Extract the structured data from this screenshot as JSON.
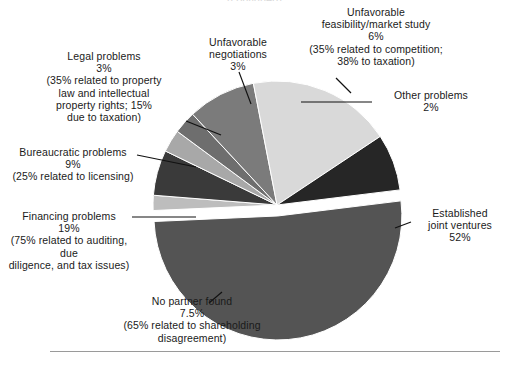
{
  "figure": {
    "clipped_title": "(continued)",
    "background": "#ffffff",
    "rule_color": "#9a9a9a"
  },
  "chart_data": {
    "type": "pie",
    "title": "",
    "xlabel": "",
    "ylabel": "",
    "legend_position": "none",
    "grid": false,
    "labels_outside": true,
    "total": 100,
    "categories": [
      "Established joint ventures",
      "Financing problems",
      "Bureaucratic problems",
      "No partner found",
      "Unfavorable feasibility/market study",
      "Legal problems",
      "Unfavorable negotiations",
      "Other problems"
    ],
    "values": [
      52,
      19,
      9,
      7.5,
      6,
      3,
      3,
      2
    ],
    "value_labels": [
      "52%",
      "19%",
      "9%",
      "7.5%",
      "6%",
      "3%",
      "3%",
      "2%"
    ],
    "colors": [
      "#545454",
      "#d9d9d9",
      "#7b7b7b",
      "#262626",
      "#bdbdbd",
      "#6e6e6e",
      "#a8a8a8",
      "#3a3a3a"
    ],
    "exploded": [
      "Established joint ventures"
    ],
    "slices": [
      {
        "name": "established-joint-ventures",
        "label": "Established\njoint ventures",
        "value_label": "52%",
        "note": "",
        "color": "#545454"
      },
      {
        "name": "other-problems",
        "label": "Other problems",
        "value_label": "2%",
        "note": "",
        "color": "#bdbdbd"
      },
      {
        "name": "unfavorable-feasibility-market-study",
        "label": "Unfavorable\nfeasibility/market study",
        "value_label": "6%",
        "note": "(35% related to competition;\n38% to taxation)",
        "color": "#3a3a3a"
      },
      {
        "name": "unfavorable-negotiations",
        "label": "Unfavorable\nnegotiations",
        "value_label": "3%",
        "note": "",
        "color": "#a8a8a8"
      },
      {
        "name": "legal-problems",
        "label": "Legal problems",
        "value_label": "3%",
        "note": "(35% related to property\nlaw and intellectual\nproperty rights; 15%\ndue to taxation)",
        "color": "#6e6e6e"
      },
      {
        "name": "bureaucratic-problems",
        "label": "Bureaucratic problems",
        "value_label": "9%",
        "note": "(25% related to licensing)",
        "color": "#7b7b7b"
      },
      {
        "name": "financing-problems",
        "label": "Financing problems",
        "value_label": "19%",
        "note": "(75% related to auditing, due\ndiligence, and tax issues)",
        "color": "#d9d9d9"
      },
      {
        "name": "no-partner-found",
        "label": "No partner found",
        "value_label": "7.5%",
        "note": "(65% related to shareholding\ndisagreement)",
        "color": "#262626"
      }
    ]
  },
  "callouts": {
    "established_joint_ventures": "Established\njoint ventures\n52%",
    "other_problems": "Other problems\n2%",
    "unfavorable_feasibility": "Unfavorable\nfeasibility/market study\n6%\n(35% related to competition;\n38% to taxation)",
    "unfavorable_negotiations": "Unfavorable\nnegotiations\n3%",
    "legal_problems": "Legal problems\n3%\n(35% related to property\nlaw and intellectual\nproperty rights; 15%\ndue to taxation)",
    "bureaucratic_problems": "Bureaucratic problems\n9%\n(25% related to licensing)",
    "financing_problems": "Financing problems\n19%\n(75% related to auditing, due\ndiligence, and tax issues)",
    "no_partner_found": "No partner found\n7.5%\n(65% related to shareholding\ndisagreement)"
  }
}
